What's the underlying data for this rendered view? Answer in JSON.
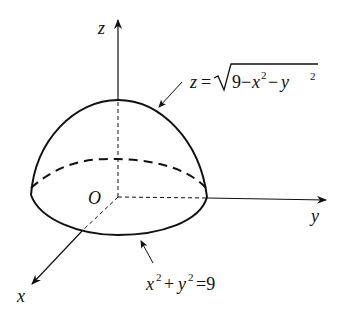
{
  "diagram": {
    "type": "3d-surface-sketch",
    "colors": {
      "ink": "#111111",
      "background": "#ffffff"
    },
    "axes": {
      "x_label": "x",
      "y_label": "y",
      "z_label": "z",
      "origin_label": "O"
    },
    "annotations": {
      "surface": {
        "lhs": "z",
        "eq": "=",
        "radical": "9−x",
        "exp1": "2",
        "minus": "−y",
        "exp2": "2"
      },
      "boundary": {
        "x": "x",
        "exp1": "2",
        "plus": "+",
        "y": "y",
        "exp2": "2",
        "rhs": "=9"
      }
    }
  }
}
